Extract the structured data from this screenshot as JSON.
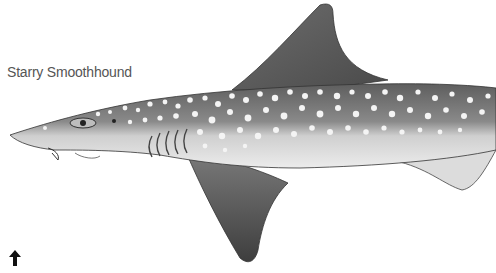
{
  "illustration": {
    "subject": "shark",
    "caption": "Starry Smoothhound"
  },
  "controls": {
    "arrow_icon": "up-arrow-icon"
  }
}
